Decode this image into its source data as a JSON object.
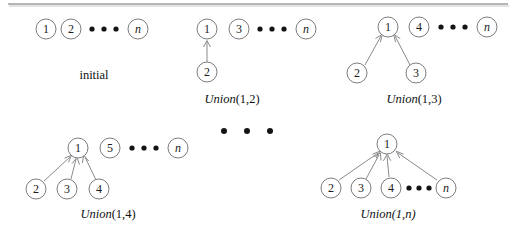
{
  "figure": {
    "title_rule": "horizontal-rule",
    "background_color": "#ffffff",
    "node_stroke_color": "#7d7d7d",
    "edge_stroke_color": "#8a8a8a",
    "text_color": "#111111",
    "groups": [
      {
        "id": "initial",
        "caption_word": "",
        "caption_args": "initial",
        "caption_style": "roman",
        "nodes": [
          {
            "label": "1",
            "style": "roman",
            "cx": 46,
            "cy": 29,
            "r": 10
          },
          {
            "label": "2",
            "style": "roman",
            "cx": 71,
            "cy": 29,
            "r": 10
          },
          {
            "label": "n",
            "style": "italic",
            "cx": 138,
            "cy": 29,
            "r": 10
          }
        ],
        "ellipsis": [
          {
            "cx": 92,
            "cy": 29
          },
          {
            "cx": 104,
            "cy": 29
          },
          {
            "cx": 116,
            "cy": 29
          }
        ],
        "edges": [],
        "caption_x": 94,
        "caption_y": 79
      },
      {
        "id": "union-1-2",
        "caption_word": "Union",
        "caption_args": "(1,2)",
        "caption_style": "italic-roman",
        "nodes": [
          {
            "label": "1",
            "style": "roman",
            "cx": 207,
            "cy": 29,
            "r": 10
          },
          {
            "label": "3",
            "style": "roman",
            "cx": 239,
            "cy": 29,
            "r": 10
          },
          {
            "label": "n",
            "style": "italic",
            "cx": 306,
            "cy": 29,
            "r": 10
          },
          {
            "label": "2",
            "style": "roman",
            "cx": 207,
            "cy": 72,
            "r": 10
          }
        ],
        "ellipsis": [
          {
            "cx": 260,
            "cy": 29
          },
          {
            "cx": 272,
            "cy": 29
          },
          {
            "cx": 284,
            "cy": 29
          }
        ],
        "edges": [
          {
            "from": 3,
            "to": 0
          }
        ],
        "caption_x": 232,
        "caption_y": 103
      },
      {
        "id": "union-1-3",
        "caption_word": "Union",
        "caption_args": "(1,3)",
        "caption_style": "italic-roman",
        "nodes": [
          {
            "label": "1",
            "style": "roman",
            "cx": 388,
            "cy": 27,
            "r": 10
          },
          {
            "label": "4",
            "style": "roman",
            "cx": 419,
            "cy": 27,
            "r": 10
          },
          {
            "label": "n",
            "style": "italic",
            "cx": 487,
            "cy": 27,
            "r": 10
          },
          {
            "label": "2",
            "style": "roman",
            "cx": 357,
            "cy": 73,
            "r": 10
          },
          {
            "label": "3",
            "style": "roman",
            "cx": 416,
            "cy": 73,
            "r": 10
          }
        ],
        "ellipsis": [
          {
            "cx": 441,
            "cy": 27
          },
          {
            "cx": 453,
            "cy": 27
          },
          {
            "cx": 465,
            "cy": 27
          }
        ],
        "edges": [
          {
            "from": 3,
            "to": 0
          },
          {
            "from": 4,
            "to": 0
          }
        ],
        "caption_x": 414,
        "caption_y": 103
      },
      {
        "id": "union-1-4",
        "caption_word": "Union",
        "caption_args": "(1,4)",
        "caption_style": "italic-roman",
        "nodes": [
          {
            "label": "1",
            "style": "roman",
            "cx": 78,
            "cy": 148,
            "r": 10
          },
          {
            "label": "5",
            "style": "roman",
            "cx": 110,
            "cy": 148,
            "r": 10
          },
          {
            "label": "n",
            "style": "italic",
            "cx": 178,
            "cy": 148,
            "r": 10
          },
          {
            "label": "2",
            "style": "roman",
            "cx": 36,
            "cy": 189,
            "r": 10
          },
          {
            "label": "3",
            "style": "roman",
            "cx": 67,
            "cy": 189,
            "r": 10
          },
          {
            "label": "4",
            "style": "roman",
            "cx": 99,
            "cy": 189,
            "r": 10
          }
        ],
        "ellipsis": [
          {
            "cx": 132,
            "cy": 148
          },
          {
            "cx": 144,
            "cy": 148
          },
          {
            "cx": 156,
            "cy": 148
          }
        ],
        "edges": [
          {
            "from": 3,
            "to": 0
          },
          {
            "from": 4,
            "to": 0
          },
          {
            "from": 5,
            "to": 0
          }
        ],
        "caption_x": 108,
        "caption_y": 218
      },
      {
        "id": "union-1-n",
        "caption_word": "Union",
        "caption_args": "(1,n)",
        "caption_style": "italic-italic-n",
        "nodes": [
          {
            "label": "1",
            "style": "roman",
            "cx": 387,
            "cy": 144,
            "r": 10
          },
          {
            "label": "2",
            "style": "roman",
            "cx": 331,
            "cy": 188,
            "r": 10
          },
          {
            "label": "3",
            "style": "roman",
            "cx": 361,
            "cy": 188,
            "r": 10
          },
          {
            "label": "4",
            "style": "roman",
            "cx": 391,
            "cy": 188,
            "r": 10
          },
          {
            "label": "n",
            "style": "italic",
            "cx": 446,
            "cy": 188,
            "r": 10
          }
        ],
        "ellipsis": [
          {
            "cx": 409,
            "cy": 188
          },
          {
            "cx": 419,
            "cy": 188
          },
          {
            "cx": 429,
            "cy": 188
          }
        ],
        "edges": [
          {
            "from": 1,
            "to": 0
          },
          {
            "from": 2,
            "to": 0
          },
          {
            "from": 3,
            "to": 0
          },
          {
            "from": 4,
            "to": 0
          }
        ],
        "caption_x": 388,
        "caption_y": 218
      }
    ],
    "separator_dots": [
      {
        "cx": 224,
        "cy": 131,
        "r": 3
      },
      {
        "cx": 247,
        "cy": 131,
        "r": 3
      },
      {
        "cx": 270,
        "cy": 131,
        "r": 3
      }
    ],
    "rule": {
      "x1": 8,
      "y1": 4,
      "x2": 508,
      "y2": 4
    }
  }
}
